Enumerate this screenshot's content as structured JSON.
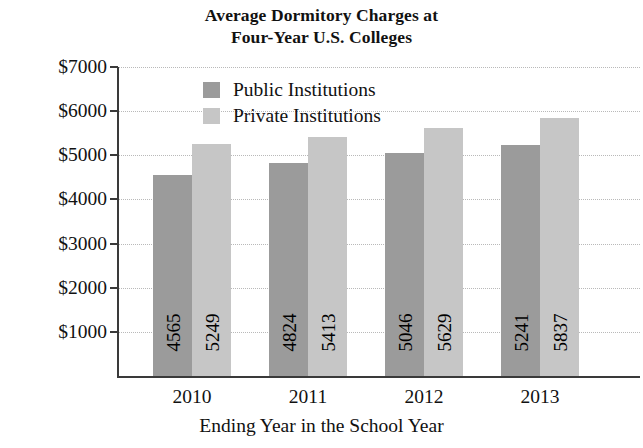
{
  "chart_data": {
    "type": "bar",
    "title": "Average Dormitory Charges at Four-Year U.S. Colleges",
    "title_line1": "Average Dormitory Charges at",
    "title_line2": "Four-Year U.S. Colleges",
    "xlabel": "Ending Year in the School Year",
    "ylabel": "Dormitory Charges",
    "categories": [
      "2010",
      "2011",
      "2012",
      "2013"
    ],
    "series": [
      {
        "name": "Public Institutions",
        "color": "#9b9b9b",
        "values": [
          4565,
          4824,
          5046,
          5241
        ]
      },
      {
        "name": "Private Institutions",
        "color": "#c6c6c6",
        "values": [
          5249,
          5413,
          5629,
          5837
        ]
      }
    ],
    "ylim": [
      0,
      7000
    ],
    "ytick_values": [
      1000,
      2000,
      3000,
      4000,
      5000,
      6000,
      7000
    ],
    "ytick_labels": [
      "$1000",
      "$2000",
      "$3000",
      "$4000",
      "$5000",
      "$6000",
      "$7000"
    ],
    "grid": true,
    "grid_style": "dotted",
    "legend_position": "inside-top-center",
    "value_labels_rotated": true
  },
  "legend": {
    "items": [
      {
        "label": "Public Institutions",
        "color": "#9b9b9b"
      },
      {
        "label": "Private Institutions",
        "color": "#c6c6c6"
      }
    ]
  }
}
